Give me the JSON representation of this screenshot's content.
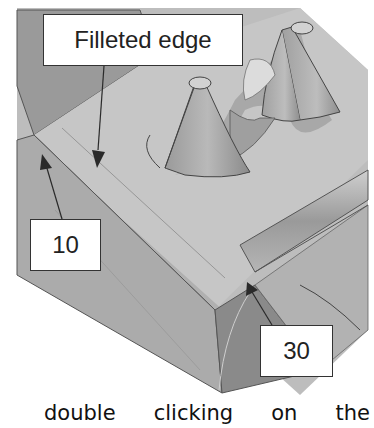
{
  "figure": {
    "callouts": {
      "filleted_edge": "Filleted edge",
      "radius_left": "10",
      "radius_right": "30"
    },
    "colors": {
      "background_surface": "#b8b8b8",
      "top_face": "#c4c4c4",
      "dark_face": "#8c8c8c",
      "mid_face": "#a6a6a6",
      "callout_bg": "#ffffff",
      "callout_border": "#333333",
      "arrow": "#2a2a2a"
    }
  },
  "caption": {
    "words": [
      "double",
      "clicking",
      "on",
      "the"
    ]
  }
}
